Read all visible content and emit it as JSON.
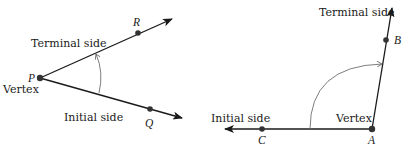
{
  "figure_left": {
    "labels": {
      "terminal_side": "Terminal side",
      "initial_side": "Initial side",
      "vertex": "Vertex"
    },
    "points": {
      "vertex": "P",
      "terminal_point": "R",
      "initial_point": "Q"
    }
  },
  "figure_right": {
    "labels": {
      "terminal_side": "Terminal side",
      "initial_side": "Initial side",
      "vertex": "Vertex"
    },
    "points": {
      "vertex": "A",
      "terminal_point": "B",
      "initial_point": "C"
    }
  },
  "colors": {
    "ray": "#1a1a1a",
    "arc": "#6e6e6e",
    "point": "#333333"
  }
}
